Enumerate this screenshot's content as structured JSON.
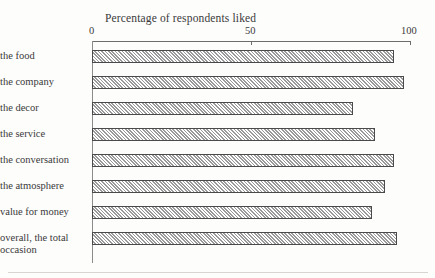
{
  "chart_data": {
    "type": "bar",
    "orientation": "horizontal",
    "title": "Percentage of respondents liked",
    "xlabel": "",
    "ylabel": "",
    "xlim": [
      0,
      100
    ],
    "grid": false,
    "legend": false,
    "tick_labels": [
      "0",
      "50",
      "100"
    ],
    "tick_values": [
      0,
      50,
      100
    ],
    "categories": [
      "the food",
      "the company",
      "the decor",
      "the service",
      "the conversation",
      "the atmosphere",
      "value for money",
      "overall, the total occasion"
    ],
    "values": [
      95,
      98,
      82,
      89,
      95,
      92,
      88,
      96
    ],
    "bar_style": {
      "fill": "diagonal-hatch",
      "hatch_color": "#9a9a9a",
      "background": "#ffffff",
      "border_color": "#4a4a4a"
    }
  }
}
